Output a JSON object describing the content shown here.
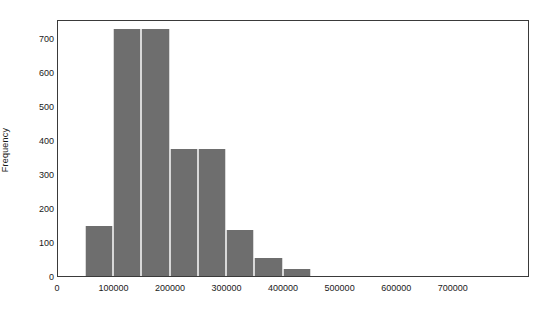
{
  "chart_data": {
    "type": "bar",
    "title": "",
    "subtitle": "",
    "xlabel": "",
    "ylabel": "Frequency",
    "xlim": [
      0,
      835000
    ],
    "ylim": [
      0,
      755
    ],
    "grid": false,
    "legend": false,
    "bin_width": 50000,
    "bin_edges": [
      50000,
      100000,
      150000,
      200000,
      250000,
      300000,
      350000,
      400000,
      450000
    ],
    "categories": [
      "50000-100000",
      "100000-150000",
      "150000-200000",
      "200000-250000",
      "250000-300000",
      "300000-350000",
      "350000-400000",
      "400000-450000"
    ],
    "bin_starts": [
      50000,
      100000,
      150000,
      200000,
      250000,
      300000,
      350000,
      400000
    ],
    "values": [
      148,
      725,
      725,
      372,
      372,
      136,
      52,
      20
    ],
    "bars": [
      {
        "label": "50000-100000",
        "start": 50000,
        "end": 100000,
        "value": 148
      },
      {
        "label": "100000-150000",
        "start": 100000,
        "end": 150000,
        "value": 725
      },
      {
        "label": "150000-200000",
        "start": 150000,
        "end": 200000,
        "value": 725
      },
      {
        "label": "200000-250000",
        "start": 200000,
        "end": 250000,
        "value": 372
      },
      {
        "label": "250000-300000",
        "start": 250000,
        "end": 300000,
        "value": 372
      },
      {
        "label": "300000-350000",
        "start": 300000,
        "end": 350000,
        "value": 136
      },
      {
        "label": "350000-400000",
        "start": 350000,
        "end": 400000,
        "value": 52
      },
      {
        "label": "400000-450000",
        "start": 400000,
        "end": 450000,
        "value": 20
      }
    ],
    "y_ticks": [
      0,
      100,
      200,
      300,
      400,
      500,
      600,
      700
    ],
    "y_tick_labels": [
      "0",
      "100",
      "200",
      "300",
      "400",
      "500",
      "600",
      "700"
    ],
    "x_ticks": [
      0,
      100000,
      200000,
      300000,
      400000,
      500000,
      600000,
      700000
    ],
    "x_tick_labels": [
      "0",
      "100000",
      "200000",
      "300000",
      "400000",
      "500000",
      "600000",
      "700000"
    ],
    "bar_color": "#6e6e6e",
    "frame_color": "#3a3a3a",
    "background_color": "#ffffff"
  }
}
